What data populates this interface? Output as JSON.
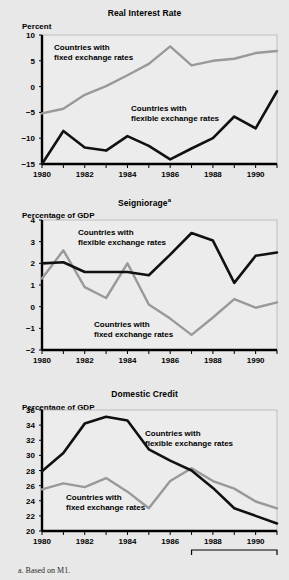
{
  "figure": {
    "footnote": "a. Based on M1.",
    "colors": {
      "flexible": "#111111",
      "fixed": "#999999",
      "background": "#e8e8e8",
      "plot_background": "#ececec",
      "axis": "#000000"
    }
  },
  "chart_data": [
    {
      "type": "line",
      "title": "Real Interest Rate",
      "ylabel": "Percent",
      "xlabel": "",
      "x": [
        1980,
        1981,
        1982,
        1983,
        1984,
        1985,
        1986,
        1987,
        1988,
        1989,
        1990,
        1991
      ],
      "xticks": [
        1980,
        1982,
        1984,
        1986,
        1988,
        1990
      ],
      "xticklabels": [
        "1980",
        "1982",
        "1984",
        "1986",
        "1988",
        "1990"
      ],
      "yticks": [
        -15,
        -10,
        -5,
        0,
        5,
        10
      ],
      "yticklabels": [
        "−15",
        "−10",
        "−5",
        "0",
        "5",
        "10"
      ],
      "ylim": [
        -15,
        10
      ],
      "xlim": [
        1980,
        1991
      ],
      "grid": false,
      "legend_position": "inline-annotation",
      "series": [
        {
          "name": "Countries with fixed exchange rates",
          "color": "#999999",
          "values": [
            -5.2,
            -4.3,
            -1.6,
            0.1,
            2.2,
            4.4,
            7.8,
            4.1,
            5.0,
            5.4,
            6.5,
            6.9
          ]
        },
        {
          "name": "Countries with flexible exchange rates",
          "color": "#111111",
          "values": [
            -15.0,
            -8.6,
            -11.8,
            -12.4,
            -9.6,
            -11.5,
            -14.1,
            -12.0,
            -10.0,
            -5.8,
            -8.1,
            -0.9
          ]
        }
      ],
      "annotations": [
        {
          "text_line1": "Countries with",
          "text_line2": "fixed exchange rates"
        },
        {
          "text_line1": "Countries with",
          "text_line2": "flexible exchange rates"
        }
      ]
    },
    {
      "type": "line",
      "title": "Seigniorage",
      "title_superscript": "a",
      "ylabel": "Percentage of GDP",
      "xlabel": "",
      "x": [
        1980,
        1981,
        1982,
        1983,
        1984,
        1985,
        1986,
        1987,
        1988,
        1989,
        1990,
        1991
      ],
      "xticks": [
        1980,
        1982,
        1984,
        1986,
        1988,
        1990
      ],
      "xticklabels": [
        "1980",
        "1982",
        "1984",
        "1986",
        "1988",
        "1990"
      ],
      "yticks": [
        -2,
        -1,
        0,
        1,
        2,
        3,
        4
      ],
      "yticklabels": [
        "−2",
        "−1",
        "0",
        "1",
        "2",
        "3",
        "4"
      ],
      "ylim": [
        -2,
        4
      ],
      "xlim": [
        1980,
        1991
      ],
      "grid": false,
      "legend_position": "inline-annotation",
      "series": [
        {
          "name": "Countries with flexible exchange rates",
          "color": "#111111",
          "values": [
            2.0,
            2.05,
            1.6,
            1.6,
            1.6,
            1.45,
            2.4,
            3.4,
            3.05,
            1.1,
            2.35,
            2.5
          ]
        },
        {
          "name": "Countries with fixed exchange rates",
          "color": "#999999",
          "values": [
            1.3,
            2.6,
            0.9,
            0.4,
            2.0,
            0.1,
            -0.55,
            -1.3,
            -0.5,
            0.35,
            -0.05,
            0.2
          ]
        }
      ],
      "annotations": [
        {
          "text_line1": "Countries with",
          "text_line2": "flexible exchange rates"
        },
        {
          "text_line1": "Countries with",
          "text_line2": "fixed exchange rates"
        }
      ]
    },
    {
      "type": "line",
      "title": "Domestic Credit",
      "ylabel": "Percentage of GDP",
      "xlabel": "",
      "x": [
        1980,
        1981,
        1982,
        1983,
        1984,
        1985,
        1986,
        1987,
        1988,
        1989,
        1990,
        1991
      ],
      "xticks": [
        1980,
        1982,
        1984,
        1986,
        1988,
        1990
      ],
      "xticklabels": [
        "1980",
        "1982",
        "1984",
        "1986",
        "1988",
        "1990"
      ],
      "yticks": [
        20,
        22,
        24,
        26,
        28,
        30,
        32,
        34,
        36
      ],
      "yticklabels": [
        "20",
        "22",
        "24",
        "26",
        "28",
        "30",
        "32",
        "34",
        "36"
      ],
      "ylim": [
        20,
        36
      ],
      "xlim": [
        1980,
        1991
      ],
      "grid": false,
      "legend_position": "inline-annotation",
      "bracket": {
        "label": "Adjustment period",
        "start": 1987,
        "end": 1991
      },
      "series": [
        {
          "name": "Countries with flexible exchange rates",
          "color": "#111111",
          "values": [
            27.9,
            30.3,
            34.2,
            35.1,
            34.6,
            30.8,
            29.3,
            28.0,
            25.7,
            23.0,
            22.0,
            21.0
          ]
        },
        {
          "name": "Countries with fixed exchange rates",
          "color": "#999999",
          "values": [
            25.5,
            26.3,
            25.8,
            27.0,
            25.2,
            23.0,
            26.6,
            28.3,
            26.6,
            25.6,
            23.9,
            23.0
          ]
        }
      ],
      "annotations": [
        {
          "text_line1": "Countries with",
          "text_line2": "flexible exchange rates"
        },
        {
          "text_line1": "Countries with",
          "text_line2": "fixed exchange rates"
        }
      ]
    }
  ]
}
